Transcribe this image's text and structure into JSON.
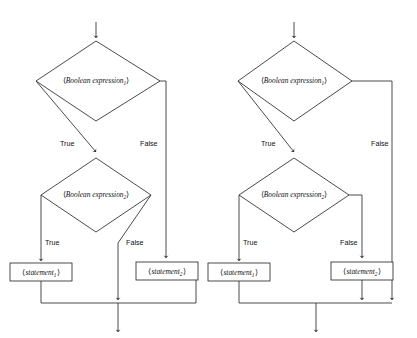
{
  "figure": {
    "type": "flowchart-pair",
    "background_color": "#ffffff",
    "line_color": "#2b2b2b"
  },
  "labels": {
    "bracket_open": "⟨",
    "bracket_close": "⟩",
    "boolean_expression": "Boolean expression",
    "statement": "statement",
    "sub_1": "1",
    "sub_2": "2",
    "true": "True",
    "false": "False"
  },
  "diagrams": [
    {
      "id": "left",
      "name": "else-binds-to-outer-if",
      "outer_decision": {
        "text": "⟨Boolean expression₁⟩",
        "true_label": "True",
        "false_label": "False",
        "false_target": "statement-2-box"
      },
      "inner_decision": {
        "text": "⟨Boolean expression₂⟩",
        "true_label": "True",
        "false_label": "False",
        "false_target": "merge-line"
      },
      "statement_boxes": [
        {
          "id": "statement-1-box",
          "text": "⟨statement₁⟩"
        },
        {
          "id": "statement-2-box",
          "text": "⟨statement₂⟩"
        }
      ]
    },
    {
      "id": "right",
      "name": "else-binds-to-inner-if",
      "outer_decision": {
        "text": "⟨Boolean expression₁⟩",
        "true_label": "True",
        "false_label": "False",
        "false_target": "merge-line"
      },
      "inner_decision": {
        "text": "⟨Boolean expression₂⟩",
        "true_label": "True",
        "false_label": "False",
        "false_target": "statement-2-box"
      },
      "statement_boxes": [
        {
          "id": "statement-1-box",
          "text": "⟨statement₁⟩"
        },
        {
          "id": "statement-2-box",
          "text": "⟨statement₂⟩"
        }
      ]
    }
  ]
}
